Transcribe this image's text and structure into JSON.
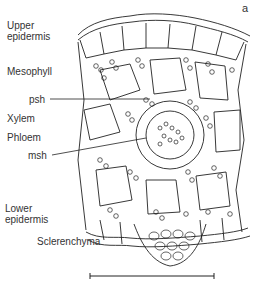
{
  "figure": {
    "panel_label": "a",
    "labels": {
      "upper_epidermis": "Upper\nepidermis",
      "mesophyll": "Mesophyll",
      "psh": "psh",
      "xylem": "Xylem",
      "phloem": "Phloem",
      "msh": "msh",
      "lower_epidermis": "Lower\nepidermis",
      "sclerenchyma": "Sclerenchyma"
    },
    "scale_bar": "scale-bar"
  }
}
